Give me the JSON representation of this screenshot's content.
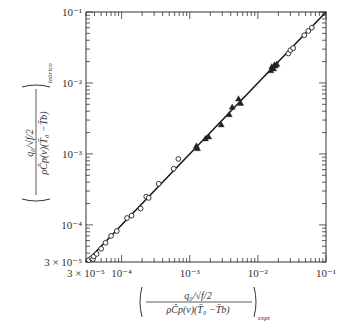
{
  "chart_data": {
    "type": "scatter",
    "title": "",
    "xlabel": "( q0/√(f/2) / (ρ Ĉp(v)(T̄0 − T̄b)) )_expt",
    "ylabel": "( q0/√(f/2) / (ρ Ĉp(v)(T̄0 − T̄b)) )_teórico",
    "xlabel_parts": {
      "numerator": "q₀/√f/2",
      "denominator": "ρĈp(v)(T̄₀ −T̄b)",
      "subscript": "expt"
    },
    "ylabel_parts": {
      "numerator": "q₀/√f/2",
      "denominator": "ρĈp(v)(T̄₀ −T̄b)",
      "subscript": "teórico"
    },
    "xscale": "log",
    "yscale": "log",
    "xlim": [
      3e-05,
      0.1
    ],
    "ylim": [
      3e-05,
      0.1
    ],
    "x_ticks": [
      "3 × 10⁻⁵",
      "10⁻⁴",
      "10⁻³",
      "10⁻²",
      "10⁻¹"
    ],
    "y_ticks": [
      "3 × 10⁻⁵",
      "10⁻⁴",
      "10⁻³",
      "10⁻²",
      "10⁻¹"
    ],
    "grid": false,
    "legend": null,
    "line": {
      "name": "y = x",
      "x": [
        3e-05,
        0.1
      ],
      "y": [
        3e-05,
        0.1
      ]
    },
    "series": [
      {
        "name": "open circles",
        "marker": "circle-open",
        "points": [
          [
            3.3e-05,
            3.2e-05
          ],
          [
            3.6e-05,
            3.4e-05
          ],
          [
            3.8e-05,
            3.3e-05
          ],
          [
            3.9e-05,
            3.6e-05
          ],
          [
            4.3e-05,
            3.9e-05
          ],
          [
            5e-05,
            4.6e-05
          ],
          [
            5.8e-05,
            5.6e-05
          ],
          [
            7e-05,
            7e-05
          ],
          [
            8.5e-05,
            8.2e-05
          ],
          [
            0.00012,
            0.000125
          ],
          [
            0.00014,
            0.000135
          ],
          [
            0.00019,
            0.00017
          ],
          [
            0.00023,
            0.00025
          ],
          [
            0.00025,
            0.00024
          ],
          [
            0.00035,
            0.00038
          ],
          [
            0.00058,
            0.00062
          ],
          [
            0.00068,
            0.00085
          ],
          [
            0.028,
            0.026
          ],
          [
            0.03,
            0.029
          ],
          [
            0.033,
            0.031
          ],
          [
            0.048,
            0.047
          ],
          [
            0.055,
            0.054
          ],
          [
            0.062,
            0.06
          ]
        ]
      },
      {
        "name": "filled triangles",
        "marker": "triangle-filled",
        "points": [
          [
            0.00125,
            0.0013
          ],
          [
            0.0013,
            0.0012
          ],
          [
            0.0017,
            0.00165
          ],
          [
            0.0019,
            0.00175
          ],
          [
            0.0029,
            0.0026
          ],
          [
            0.0038,
            0.0036
          ],
          [
            0.0042,
            0.0046
          ],
          [
            0.0052,
            0.006
          ],
          [
            0.0056,
            0.0052
          ],
          [
            0.0155,
            0.015
          ],
          [
            0.016,
            0.017
          ],
          [
            0.017,
            0.016
          ],
          [
            0.0175,
            0.018
          ],
          [
            0.018,
            0.0175
          ],
          [
            0.019,
            0.0185
          ]
        ]
      }
    ]
  },
  "colors": {
    "axis": "#333333",
    "marker": "#222222",
    "line": "#1a1a1a",
    "background": "#ffffff"
  }
}
